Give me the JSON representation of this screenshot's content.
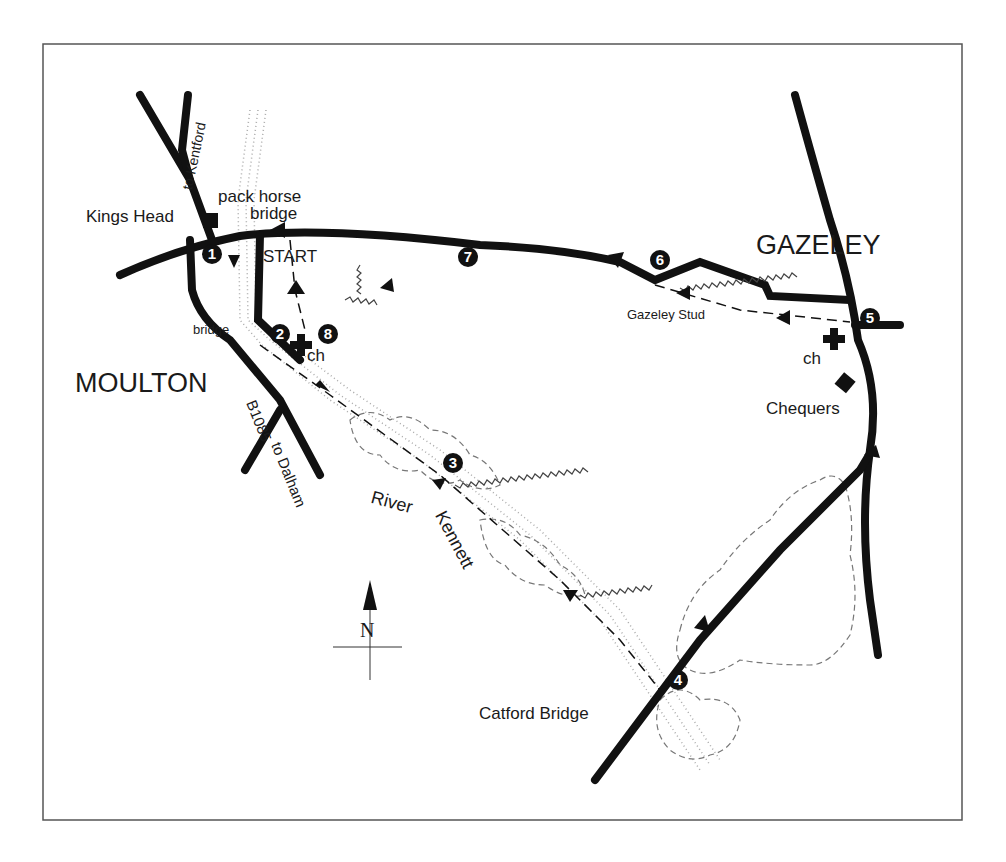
{
  "map": {
    "places": {
      "moulton": "MOULTON",
      "gazeley": "GAZELEY"
    },
    "labels": {
      "kings_head": "Kings Head",
      "pack_horse": "pack horse",
      "pack_horse_bridge": "bridge",
      "start": "START",
      "bridge_moulton": "bridge",
      "church_moulton": "ch",
      "road_b1085": "B1085",
      "to_dalham": "to Dalham",
      "to_kentford": "to Kentford",
      "river": "River",
      "kennett": "Kennett",
      "gazeley_stud": "Gazeley Stud",
      "church_gazeley": "ch",
      "chequers": "Chequers",
      "catford_bridge": "Catford Bridge",
      "north": "N"
    },
    "waypoints": [
      "1",
      "2",
      "3",
      "4",
      "5",
      "6",
      "7",
      "8"
    ],
    "colors": {
      "ink": "#111111",
      "frame": "#555555",
      "dots": "#999999",
      "woods": "#777777"
    }
  }
}
